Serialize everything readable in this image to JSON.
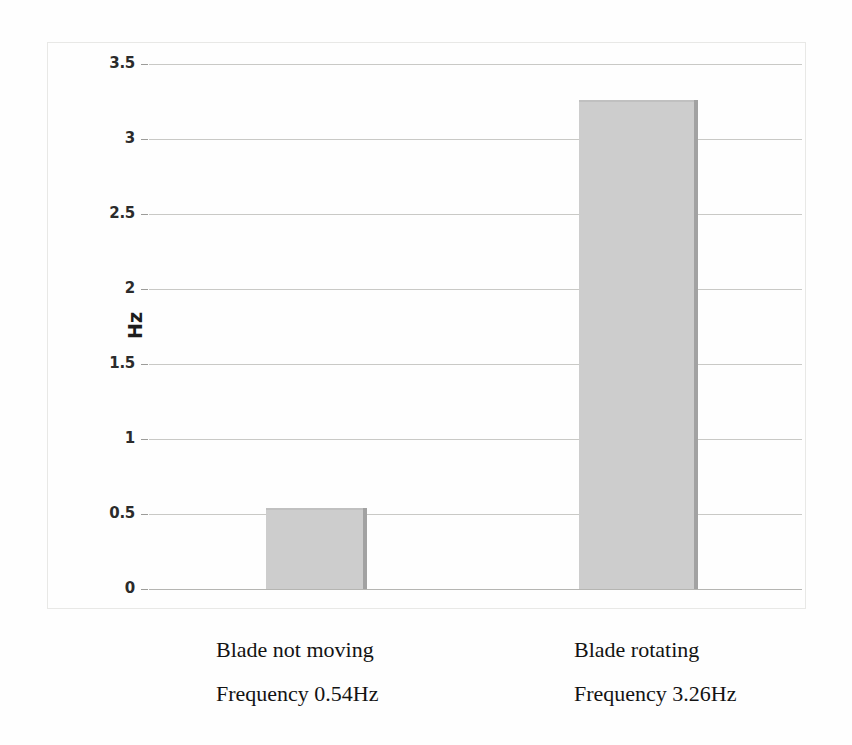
{
  "chart_data": {
    "type": "bar",
    "title": "",
    "subtitle": "",
    "xlabel": "",
    "ylabel": "Hz",
    "ylim": [
      0,
      3.5
    ],
    "grid": true,
    "legend": "none",
    "categories": [
      "Blade not moving\nFrequency 0.54Hz",
      "Blade rotating\nFrequency 3.26Hz"
    ],
    "values": [
      0.54,
      3.26
    ],
    "yticks": [
      "0",
      "0.5",
      "1",
      "1.5",
      "2",
      "2.5",
      "3",
      "3.5"
    ],
    "ytick_values": [
      0,
      0.5,
      1,
      1.5,
      2,
      2.5,
      3,
      3.5
    ],
    "bar_color": "#cdcdcd",
    "bar_shadow_color": "#a2a2a2",
    "gridline_color": "#c9c9c6",
    "frame_color": "#e8e8e6",
    "background_color": "#fefefe"
  },
  "axis": {
    "y_title": "Hz"
  },
  "categories": [
    {
      "id": "blade-not-moving",
      "line1": "Blade not moving",
      "line2": "Frequency 0.54Hz",
      "value": 0.54
    },
    {
      "id": "blade-rotating",
      "line1": "Blade rotating",
      "line2": "Frequency 3.26Hz",
      "value": 3.26
    }
  ],
  "yticks": [
    {
      "label": "3.5",
      "value": 3.5
    },
    {
      "label": "3",
      "value": 3
    },
    {
      "label": "2.5",
      "value": 2.5
    },
    {
      "label": "2",
      "value": 2
    },
    {
      "label": "1.5",
      "value": 1.5
    },
    {
      "label": "1",
      "value": 1
    },
    {
      "label": "0.5",
      "value": 0.5
    },
    {
      "label": "0",
      "value": 0
    }
  ]
}
